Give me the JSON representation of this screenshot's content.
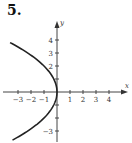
{
  "problem_label": "5.",
  "chart_data": {
    "type": "line",
    "title": "",
    "xlabel": "x",
    "ylabel": "y",
    "xlim": [
      -4,
      5
    ],
    "ylim": [
      -4,
      5
    ],
    "x_ticks": [
      -3,
      -2,
      -1,
      1,
      2,
      3,
      4
    ],
    "x_tick_labels": [
      "−3",
      "−2",
      "−1",
      "1",
      "2",
      "3",
      "4"
    ],
    "y_ticks": [
      4,
      3,
      2,
      1,
      -1,
      -2,
      -3
    ],
    "y_tick_labels": [
      "4",
      "3",
      "2",
      "",
      "",
      "",
      "−3"
    ],
    "grid": false,
    "series": [
      {
        "name": "parabola x = -y^2/4",
        "equation": "x = -y^2/4",
        "y_range": [
          -3.7,
          3.8
        ],
        "color": "#222222"
      }
    ]
  }
}
